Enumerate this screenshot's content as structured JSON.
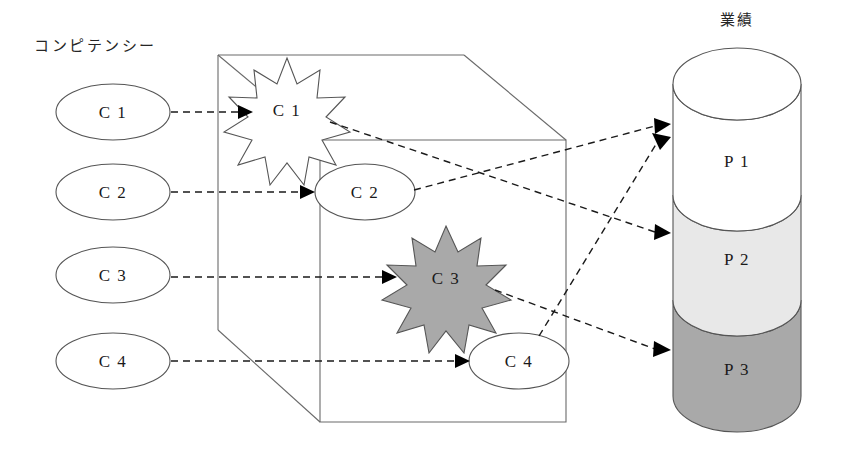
{
  "diagram": {
    "type": "concept-flow-diagram",
    "left_group": {
      "title": "コンピテンシー",
      "nodes": [
        {
          "id": "c1-source",
          "label": "C 1"
        },
        {
          "id": "c2-source",
          "label": "C 2"
        },
        {
          "id": "c3-source",
          "label": "C 3"
        },
        {
          "id": "c4-source",
          "label": "C 4"
        }
      ]
    },
    "cube_group": {
      "title": "",
      "nodes": [
        {
          "id": "c1-inner",
          "label": "C 1",
          "shape": "star",
          "fill": "#ffffff"
        },
        {
          "id": "c2-inner",
          "label": "C 2",
          "shape": "ellipse",
          "fill": "#ffffff"
        },
        {
          "id": "c3-inner",
          "label": "C 3",
          "shape": "star",
          "fill": "#a9a9a9"
        },
        {
          "id": "c4-inner",
          "label": "C 4",
          "shape": "ellipse",
          "fill": "#ffffff"
        }
      ]
    },
    "right_group": {
      "title": "業績",
      "segments": [
        {
          "id": "p1",
          "label": "P 1",
          "fill": "#ffffff"
        },
        {
          "id": "p2",
          "label": "P 2",
          "fill": "#e8e8e8"
        },
        {
          "id": "p3",
          "label": "P 3",
          "fill": "#a9a9a9"
        }
      ]
    },
    "connections": [
      {
        "from": "c1-source",
        "to": "c1-inner"
      },
      {
        "from": "c2-source",
        "to": "c2-inner"
      },
      {
        "from": "c3-source",
        "to": "c3-inner"
      },
      {
        "from": "c4-source",
        "to": "c4-inner"
      },
      {
        "from": "c1-inner",
        "to": "p2"
      },
      {
        "from": "c2-inner",
        "to": "p1"
      },
      {
        "from": "c3-inner",
        "to": "p3"
      },
      {
        "from": "c4-inner",
        "to": "p1"
      }
    ],
    "colors": {
      "stroke": "#555555",
      "text": "#1a1a1a",
      "segment_light": "#e8e8e8",
      "segment_dark": "#a9a9a9"
    }
  }
}
